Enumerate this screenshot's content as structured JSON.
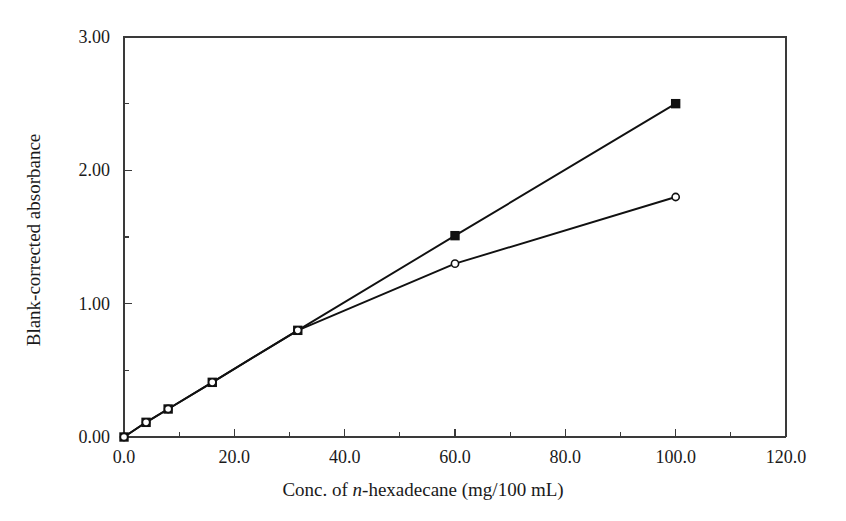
{
  "chart_data": {
    "type": "line",
    "title": "",
    "subtitle": "",
    "xlabel_parts": {
      "pre": "Conc. of ",
      "italic": "n",
      "post": "-hexadecane (mg/100 mL)"
    },
    "xlabel": "Conc. of n-hexadecane (mg/100 mL)",
    "ylabel": "Blank-corrected absorbance",
    "xlim": [
      0,
      120
    ],
    "ylim": [
      0,
      3
    ],
    "xticks": [
      0,
      20,
      40,
      60,
      80,
      100,
      120
    ],
    "xtick_labels": [
      "0.0",
      "20.0",
      "40.0",
      "60.0",
      "80.0",
      "100.0",
      "120.0"
    ],
    "xminor_ticks": [
      10,
      30,
      50,
      70,
      90,
      110
    ],
    "yticks": [
      0,
      1,
      2,
      3
    ],
    "ytick_labels": [
      "0.00",
      "1.00",
      "2.00",
      "3.00"
    ],
    "yminor_ticks": [
      0.5,
      1.5,
      2.5
    ],
    "grid": false,
    "legend_position": "none",
    "legend": [],
    "series": [
      {
        "name": "Linear response (filled squares)",
        "marker": "filled-square",
        "marker_color": "#111111",
        "line_color": "#111111",
        "x": [
          0,
          4,
          8,
          16,
          31.5,
          60,
          100
        ],
        "values": [
          0.0,
          0.11,
          0.21,
          0.41,
          0.8,
          1.51,
          2.5
        ]
      },
      {
        "name": "Saturating response (open circles)",
        "marker": "open-circle",
        "marker_color": "#111111",
        "line_color": "#111111",
        "x": [
          0,
          4,
          8,
          16,
          31.5,
          60,
          100
        ],
        "values": [
          0.0,
          0.11,
          0.21,
          0.41,
          0.8,
          1.3,
          1.8
        ]
      }
    ],
    "annotations": []
  },
  "figure": {
    "background_color": "#ffffff",
    "axis_color": "#3a3a3a",
    "data_color": "#111111"
  }
}
